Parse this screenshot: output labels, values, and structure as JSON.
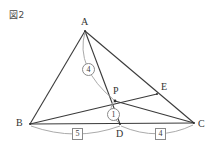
{
  "figure": {
    "caption": "図2",
    "width": 217,
    "height": 151,
    "background": "#ffffff",
    "stroke_color": "#3a3a3a",
    "arc_color": "#9a9a9a",
    "label_color": "#333333"
  },
  "points": [
    {
      "id": "A",
      "label": "A",
      "x": 85,
      "y": 31,
      "label_x": 81,
      "label_y": 17
    },
    {
      "id": "B",
      "label": "B",
      "x": 30,
      "y": 124,
      "label_x": 16,
      "label_y": 118
    },
    {
      "id": "C",
      "label": "C",
      "x": 194,
      "y": 123,
      "label_x": 198,
      "label_y": 119
    },
    {
      "id": "D",
      "label": "D",
      "x": 120,
      "y": 124,
      "label_x": 116,
      "label_y": 129
    },
    {
      "id": "E",
      "label": "E",
      "x": 157,
      "y": 94,
      "label_x": 161,
      "label_y": 82
    },
    {
      "id": "P",
      "label": "P",
      "x": 115,
      "y": 101,
      "label_x": 113,
      "label_y": 86
    }
  ],
  "segments": [
    {
      "name": "AB",
      "from": "A",
      "to": "B"
    },
    {
      "name": "AC",
      "from": "A",
      "to": "C"
    },
    {
      "name": "AD",
      "from": "A",
      "to": "D"
    },
    {
      "name": "BC",
      "from": "B",
      "to": "C"
    },
    {
      "name": "BE",
      "from": "B",
      "to": "E"
    },
    {
      "name": "PC",
      "from": "P",
      "to": "C"
    }
  ],
  "ratio_marks": {
    "circled": [
      {
        "name": "ap-ratio",
        "value": "4",
        "segment": "AP",
        "x": 82,
        "y": 63
      },
      {
        "name": "pd-ratio",
        "value": "1",
        "segment": "PD",
        "x": 107,
        "y": 108
      }
    ],
    "boxed": [
      {
        "name": "bd-ratio",
        "value": "5",
        "segment": "BD",
        "x": 72,
        "y": 128
      },
      {
        "name": "dc-ratio",
        "value": "4",
        "segment": "DC",
        "x": 155,
        "y": 128
      }
    ]
  },
  "arcs": [
    {
      "name": "arc-ap",
      "from": "A",
      "to": "P",
      "label": "4"
    },
    {
      "name": "arc-pd",
      "from": "P",
      "to": "D",
      "label": "1"
    },
    {
      "name": "arc-bd",
      "from": "B",
      "to": "D",
      "label": "5"
    },
    {
      "name": "arc-dc",
      "from": "D",
      "to": "C",
      "label": "4"
    }
  ]
}
